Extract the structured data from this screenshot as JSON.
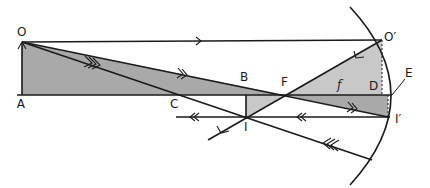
{
  "diagram": {
    "labels": {
      "O": "O",
      "A": "A",
      "B": "B",
      "C": "C",
      "F": "F",
      "I": "I",
      "O_prime": "O′",
      "I_prime": "I′",
      "D": "D",
      "E": "E",
      "f": "f"
    },
    "colors": {
      "dark_shade": "#a9a9a9",
      "light_shade": "#c8c8c8",
      "line": "#1a1a1a",
      "background": "#ffffff"
    }
  }
}
